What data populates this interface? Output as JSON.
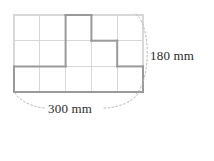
{
  "figure": {
    "type": "grid-rectangle-with-step-path",
    "grid": {
      "columns": 5,
      "rows": 3,
      "light_line_color": "#d8d8d8",
      "dark_line_color": "#9a9a9a",
      "x0": 14,
      "y0": 15,
      "x1": 143,
      "y1": 92
    },
    "dimension_labels": {
      "height": "180 mm",
      "width": "300 mm"
    },
    "leader_lines": {
      "style": "dotted-arc",
      "color": "#b5b5b5"
    }
  },
  "answer": {
    "open_paren": "(",
    "close_paren": ")",
    "value": ""
  }
}
